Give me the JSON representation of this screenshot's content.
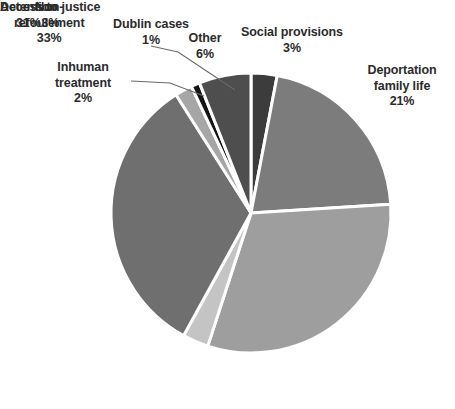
{
  "chart_data": {
    "type": "pie",
    "title": "",
    "subtitle": "",
    "xlabel": "",
    "ylabel": "",
    "grid": false,
    "legend_position": "none",
    "label_format": "name + percent",
    "units": "percent",
    "total": 100,
    "start_angle_deg": 0,
    "direction": "clockwise",
    "categories": [
      "Social provisions",
      "Deportation family life",
      "Detention",
      "Access to justice",
      "Non-refoulement",
      "Inhuman treatment",
      "Dublin cases",
      "Other"
    ],
    "values": [
      3,
      21,
      31,
      3,
      33,
      2,
      1,
      6
    ],
    "slices": [
      {
        "label": "Social provisions",
        "percent_text": "3%",
        "value": 3,
        "color": "#3c3c3c",
        "label_position": "top-center"
      },
      {
        "label": "Deportation family life",
        "percent_text": "21%",
        "value": 21,
        "color": "#7c7c7c",
        "label_position": "right-upper"
      },
      {
        "label": "Detention",
        "percent_text": "31%",
        "value": 31,
        "color": "#9e9e9e",
        "label_position": "right-lower"
      },
      {
        "label": "Access to justice",
        "percent_text": "3%",
        "value": 3,
        "color": "#c4c4c4",
        "label_position": "bottom-left"
      },
      {
        "label": "Non-refoulement",
        "percent_text": "33%",
        "value": 33,
        "color": "#6f6f6f",
        "label_position": "left-middle"
      },
      {
        "label": "Inhuman treatment",
        "percent_text": "2%",
        "value": 2,
        "color": "#a6a6a6",
        "label_position": "left-upper",
        "has_leader_line": true
      },
      {
        "label": "Dublin cases",
        "percent_text": "1%",
        "value": 1,
        "color": "#141414",
        "label_position": "top-left",
        "has_leader_line": true
      },
      {
        "label": "Other",
        "percent_text": "6%",
        "value": 6,
        "color": "#4e4e4e",
        "label_position": "top-center-left"
      }
    ],
    "style": {
      "slice_border_color": "#ffffff",
      "slice_border_width": 3,
      "label_color": "#2b2b2b",
      "leader_line_color": "#6a6a6a",
      "background": "#ffffff"
    }
  },
  "labels": {
    "dublin_cases": {
      "name": "Dublin cases",
      "pct": "1%"
    },
    "other": {
      "name": "Other",
      "pct": "6%"
    },
    "social_provisions": {
      "name": "Social provisions",
      "pct": "3%"
    },
    "inhuman_treatment": {
      "name_line1": "Inhuman",
      "name_line2": "treatment",
      "pct": "2%"
    },
    "deportation": {
      "name_line1": "Deportation",
      "name_line2": "family life",
      "pct": "21%"
    },
    "non_refoulement": {
      "name_line1": "Non-",
      "name_line2": "refoulement",
      "pct": "33%"
    },
    "access_to_justice": {
      "name": "Access to justice",
      "pct": "3%"
    },
    "detention": {
      "name": "Detention",
      "pct": "31%"
    }
  },
  "caption": {
    "text": ""
  }
}
